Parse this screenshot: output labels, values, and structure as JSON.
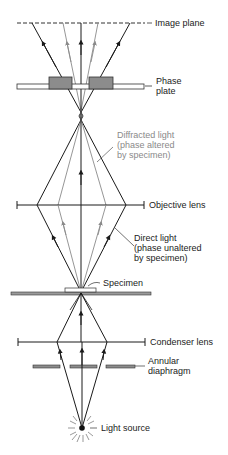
{
  "colors": {
    "direct_light": "#1a1a1a",
    "diffracted_light": "#8a8a8a",
    "phase_plate_block": "#8c8c8c",
    "diaphragm_bar": "#8c8c8c",
    "label_text": "#222222",
    "diffracted_label_text": "#8a8a8a"
  },
  "labels": {
    "image_plane": "Image plane",
    "phase_plate": "Phase\nplate",
    "diffracted_light": "Diffracted light\n(phase altered\nby specimen)",
    "objective_lens": "Objective lens",
    "direct_light": "Direct light\n(phase unaltered\nby specimen)",
    "specimen": "Specimen",
    "condenser_lens": "Condenser lens",
    "annular_diaphragm": "Annular\ndiaphragm",
    "light_source": "Light source"
  },
  "components": [
    {
      "name": "Image plane",
      "y": 23,
      "style": "dashed"
    },
    {
      "name": "Phase plate",
      "y": 86
    },
    {
      "name": "Objective lens",
      "y": 205
    },
    {
      "name": "Specimen",
      "y": 293
    },
    {
      "name": "Condenser lens",
      "y": 342
    },
    {
      "name": "Annular diaphragm",
      "y": 366
    },
    {
      "name": "Light source",
      "y": 428
    }
  ]
}
